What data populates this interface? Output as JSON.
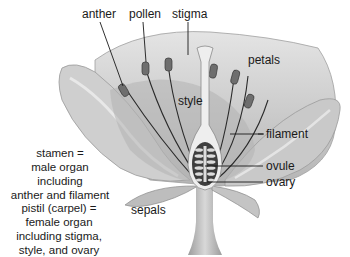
{
  "diagram": {
    "labels": {
      "anther": "anther",
      "pollen": "pollen",
      "stigma": "stigma",
      "petals": "petals",
      "style": "style",
      "filament": "filament",
      "ovule": "ovule",
      "ovary": "ovary",
      "sepals": "sepals"
    },
    "notes": {
      "stamen": [
        "stamen =",
        "male organ including",
        "anther and filament"
      ],
      "pistil": [
        "pistil (carpel) =",
        "female organ",
        "including stigma,",
        "style, and ovary"
      ]
    },
    "colors": {
      "petal_light": "#d9d9d9",
      "petal_mid": "#bdbdbd",
      "petal_dark": "#9a9a9a",
      "ink": "#1a1a1a",
      "style_fill": "#ececec"
    }
  }
}
